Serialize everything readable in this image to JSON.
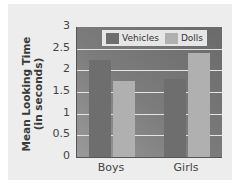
{
  "chart_data": {
    "type": "bar",
    "title": "",
    "xlabel": "",
    "ylabel": "Mean Looking Time (in seconds)",
    "ylabel_lines": [
      "Mean Looking Time",
      "(in seconds)"
    ],
    "categories": [
      "Boys",
      "Girls"
    ],
    "series": [
      {
        "name": "Vehicles",
        "values": [
          2.25,
          1.8
        ],
        "color": "#6e6e6e"
      },
      {
        "name": "Dolls",
        "values": [
          1.75,
          2.4
        ],
        "color": "#b0b0b0"
      }
    ],
    "ylim": [
      0,
      3
    ],
    "yticks": [
      "0",
      "0.5",
      "1",
      "1.5",
      "2",
      "2.5",
      "3"
    ],
    "grid": true,
    "legend_position": "top-inside"
  }
}
